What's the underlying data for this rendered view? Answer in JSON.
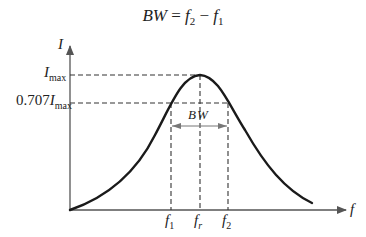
{
  "formula": {
    "lhs": "BW",
    "eq": " = ",
    "f2": "f",
    "f2_sub": "2",
    "minus": " − ",
    "f1": "f",
    "f1_sub": "1"
  },
  "axes": {
    "y_label": "I",
    "x_label": "f"
  },
  "levels": {
    "imax_main": "I",
    "imax_sub": "max",
    "half_coef": "0.707",
    "half_main": "I",
    "half_sub": "max"
  },
  "bandwidth_label": "BW",
  "frequencies": [
    {
      "main": "f",
      "sub": "1"
    },
    {
      "main": "f",
      "sub": "r"
    },
    {
      "main": "f",
      "sub": "2"
    }
  ],
  "colors": {
    "curve": "#1a1a1a",
    "axis": "#555555",
    "dashed": "#333333",
    "arrow": "#777777"
  }
}
